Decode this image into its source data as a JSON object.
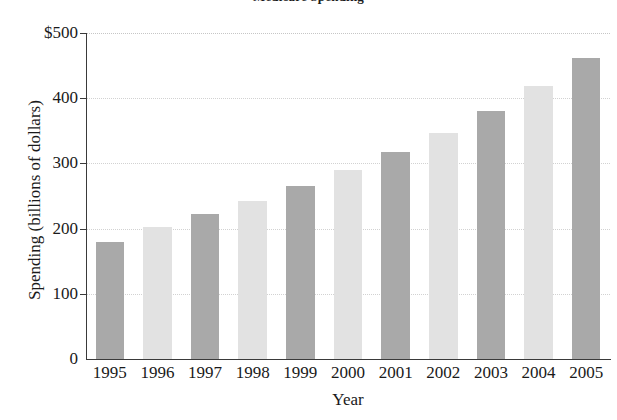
{
  "chart_data": {
    "type": "bar",
    "title": "Medicare Spending",
    "xlabel": "Year",
    "ylabel": "Spending (billions of dollars)",
    "categories": [
      "1995",
      "1996",
      "1997",
      "1998",
      "1999",
      "2000",
      "2001",
      "2002",
      "2003",
      "2004",
      "2005"
    ],
    "values": [
      180,
      202,
      222,
      242,
      265,
      290,
      317,
      346,
      381,
      418,
      461
    ],
    "ylim": [
      0,
      500
    ],
    "ytick_values": [
      0,
      100,
      200,
      300,
      400,
      500
    ],
    "ytick_labels": [
      "0",
      "100",
      "200",
      "300",
      "400",
      "$500"
    ],
    "grid": true,
    "legend": "none",
    "bar_colors": [
      "#a9a9a9",
      "#e2e2e2",
      "#a9a9a9",
      "#e2e2e2",
      "#a9a9a9",
      "#e2e2e2",
      "#a9a9a9",
      "#e2e2e2",
      "#a9a9a9",
      "#e2e2e2",
      "#a9a9a9"
    ],
    "axis_color": "#3a3a3a",
    "grid_color": "#d2d2d2",
    "text_color": "#1a1a1a",
    "background": "#ffffff"
  }
}
